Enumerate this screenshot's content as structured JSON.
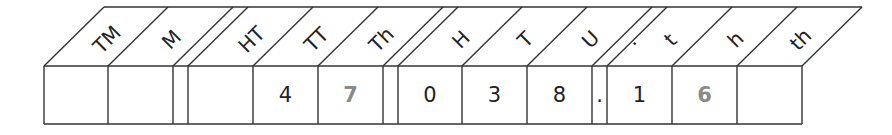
{
  "diagram": {
    "columns": [
      {
        "header": "TM",
        "value": "",
        "x1": 44,
        "x2": 108,
        "highlight": false
      },
      {
        "header": "M",
        "value": "",
        "x1": 108,
        "x2": 173,
        "highlight": false
      },
      {
        "header": "HT",
        "value": "",
        "x1": 188,
        "x2": 253,
        "highlight": false
      },
      {
        "header": "TT",
        "value": "4",
        "x1": 253,
        "x2": 318,
        "highlight": false
      },
      {
        "header": "Th",
        "value": "7",
        "x1": 318,
        "x2": 383,
        "highlight": true
      },
      {
        "header": "H",
        "value": "0",
        "x1": 398,
        "x2": 462,
        "highlight": false
      },
      {
        "header": "T",
        "value": "3",
        "x1": 462,
        "x2": 527,
        "highlight": false
      },
      {
        "header": "U",
        "value": "8",
        "x1": 527,
        "x2": 592,
        "highlight": false
      },
      {
        "header": ".",
        "value": ".",
        "x1": 592,
        "x2": 607,
        "highlight": false,
        "narrow": true
      },
      {
        "header": "t",
        "value": "1",
        "x1": 607,
        "x2": 672,
        "highlight": false
      },
      {
        "header": "h",
        "value": "6",
        "x1": 672,
        "x2": 737,
        "highlight": true
      },
      {
        "header": "th",
        "value": "",
        "x1": 737,
        "x2": 802,
        "highlight": false
      }
    ],
    "separators": [
      {
        "x1": 173,
        "x2": 188
      },
      {
        "x1": 383,
        "x2": 398
      }
    ],
    "colors": {
      "line": "#333333",
      "text": "#222222",
      "highlight": "#8a8a8a"
    }
  }
}
